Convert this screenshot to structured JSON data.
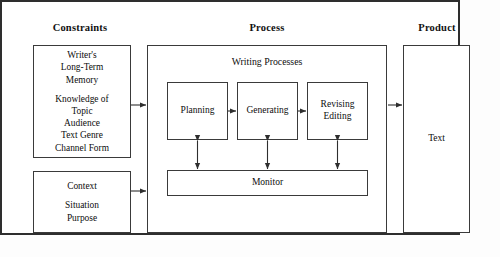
{
  "diagram": {
    "sections": [
      {
        "id": "constraints",
        "label": "Constraints"
      },
      {
        "id": "process",
        "label": "Process"
      },
      {
        "id": "product",
        "label": "Product"
      }
    ],
    "constraints": {
      "memory_box": {
        "group_a": [
          "Writer's",
          "Long-Term",
          "Memory"
        ],
        "group_b": [
          "Knowledge of",
          "Topic",
          "Audience",
          "Text Genre",
          "Channel Form"
        ]
      },
      "context_box": {
        "group_a": [
          "Context"
        ],
        "group_b": [
          "Situation",
          "Purpose"
        ]
      }
    },
    "process": {
      "group_label": "Writing Processes",
      "stages": [
        {
          "id": "planning",
          "lines": [
            "Planning"
          ]
        },
        {
          "id": "generating",
          "lines": [
            "Generating"
          ]
        },
        {
          "id": "revising-editing",
          "lines": [
            "Revising",
            "Editing"
          ]
        }
      ],
      "monitor": {
        "label": "Monitor"
      }
    },
    "product": {
      "text_box": {
        "label": "Text"
      }
    },
    "colors": {
      "line": "#3a3a3a",
      "frame": "#2e2e2e",
      "text": "#0d0d0d",
      "background": "#ffffff"
    }
  }
}
